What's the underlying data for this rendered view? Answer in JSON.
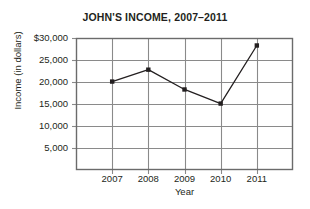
{
  "chart_data": {
    "type": "line",
    "title": "JOHN'S INCOME, 2007–2011",
    "xlabel": "Year",
    "ylabel": "Income (in dollars)",
    "categories": [
      "2007",
      "2008",
      "2009",
      "2010",
      "2011"
    ],
    "values": [
      20100,
      22800,
      18300,
      15100,
      28300
    ],
    "series": [
      {
        "name": "Income",
        "values": [
          20100,
          22800,
          18300,
          15100,
          28300
        ]
      }
    ],
    "ylim": [
      0,
      30000
    ],
    "y_ticks": [
      5000,
      10000,
      15000,
      20000,
      25000,
      30000
    ],
    "y_tick_labels": [
      "5,000",
      "10,000",
      "15,000",
      "20,000",
      "25,000",
      "$30,000"
    ],
    "x_tick_labels": [
      "2007",
      "2008",
      "2009",
      "2010",
      "2011"
    ],
    "grid": true,
    "legend": false,
    "legend_position": "none",
    "marker": "square",
    "colors": {
      "line": "#231f20",
      "marker": "#231f20",
      "grid": "#8a8a8a",
      "frame": "#6b6b6b",
      "text": "#231f20",
      "background": "#ffffff"
    }
  }
}
